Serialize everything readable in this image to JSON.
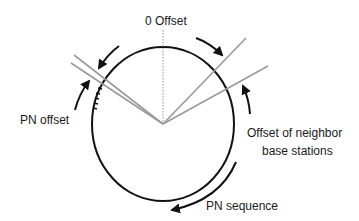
{
  "diagram": {
    "labels": {
      "zero_offset": "0 Offset",
      "pn_offset": "PN offset",
      "neighbor_line1": "Offset of neighbor",
      "neighbor_line2": "base stations",
      "pn_sequence": "PN sequence"
    },
    "colors": {
      "circle": "#111111",
      "arrows": "#111111",
      "offset_lines": "#9a9a9a",
      "zero_line": "#aaaaaa",
      "text": "#1a1a1a"
    },
    "geometry": {
      "center": [
        163,
        124
      ],
      "radius_x": 71,
      "radius_y": 77
    }
  }
}
